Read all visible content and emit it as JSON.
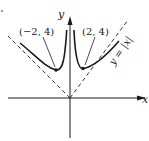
{
  "figure": {
    "type": "function-graph",
    "function_description": "curve with vertical asymptote at x=0 approaching asymptotes y=|x|",
    "axes": {
      "x_label": "x",
      "y_label": "y"
    },
    "asymptote": {
      "label": "y = |x|",
      "style": "dashed"
    },
    "points": [
      {
        "label": "(−2, 4)",
        "x": -2,
        "y": 4
      },
      {
        "label": "(2, 4)",
        "x": 2,
        "y": 4
      }
    ],
    "colors": {
      "ink": "#1a1a1a",
      "background": "#ffffff"
    }
  }
}
